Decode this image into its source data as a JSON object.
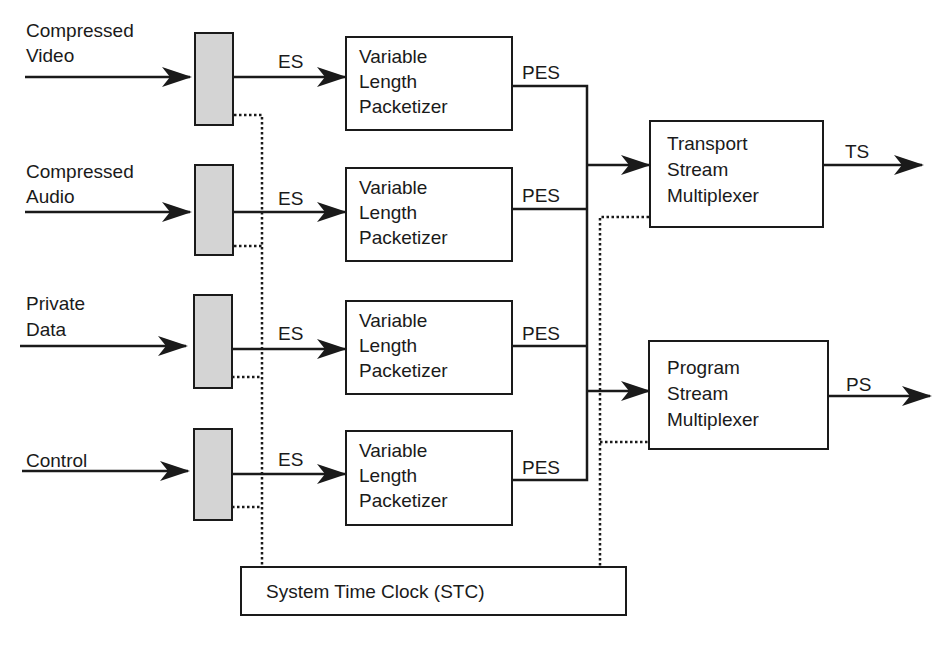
{
  "diagram": {
    "inputs": [
      {
        "label_line1": "Compressed",
        "label_line2": "Video"
      },
      {
        "label_line1": "Compressed",
        "label_line2": "Audio"
      },
      {
        "label_line1": "Private",
        "label_line2": "Data"
      },
      {
        "label_line1": "Control",
        "label_line2": ""
      }
    ],
    "es_label": "ES",
    "pes_label": "PES",
    "packetizer": {
      "line1": "Variable",
      "line2": "Length",
      "line3": "Packetizer"
    },
    "transport_mux": {
      "line1": "Transport",
      "line2": "Stream",
      "line3": "Multiplexer",
      "output": "TS"
    },
    "program_mux": {
      "line1": "Program",
      "line2": "Stream",
      "line3": "Multiplexer",
      "output": "PS"
    },
    "stc": {
      "label": "System Time Clock (STC)"
    },
    "colors": {
      "line": "#1a1a1a",
      "buffer_fill": "#d4d4d4",
      "background": "#ffffff"
    }
  }
}
